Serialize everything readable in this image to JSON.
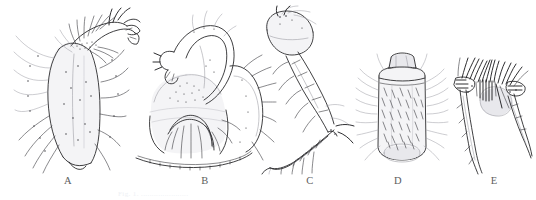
{
  "figure": {
    "kind": "scientific-line-drawing-plate",
    "medium": "pen-and-ink stipple drawing",
    "background_color": "#ffffff",
    "ink_color": "#1d1d20",
    "panel_count": 5,
    "caption_ghost_text": "Fig. 1. ......................",
    "panels": [
      {
        "id": "A",
        "label": "A",
        "label_x": 68,
        "label_y": 181,
        "name": "panel-a-palp-chela",
        "subject": "chelate palp with terminal claw and dense marginal setae",
        "x": 14,
        "y": 6,
        "width": 126,
        "height": 168
      },
      {
        "id": "B",
        "label": "B",
        "label_x": 205,
        "label_y": 181,
        "name": "panel-b-genital-plate",
        "subject": "curved appendage over broad notched subgenital plate",
        "x": 134,
        "y": 6,
        "width": 142,
        "height": 168
      },
      {
        "id": "C",
        "label": "C",
        "label_x": 310,
        "label_y": 181,
        "name": "panel-c-leg-segments",
        "subject": "elongate segmented leg, femur to tapering tarsus with spines",
        "x": 258,
        "y": 6,
        "width": 96,
        "height": 168
      },
      {
        "id": "D",
        "label": "D",
        "label_x": 398,
        "label_y": 181,
        "name": "panel-d-setose-segment",
        "subject": "rounded rectangular segment densely clothed in setae",
        "x": 356,
        "y": 52,
        "width": 92,
        "height": 122
      },
      {
        "id": "E",
        "label": "E",
        "label_x": 494,
        "label_y": 181,
        "name": "panel-e-setal-brush",
        "subject": "dark setal brush with pale sac and two tapering processes",
        "x": 452,
        "y": 56,
        "width": 80,
        "height": 118
      }
    ]
  }
}
